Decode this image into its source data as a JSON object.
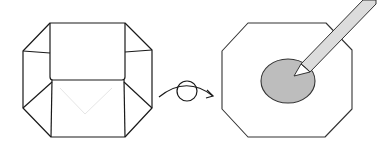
{
  "diagram": {
    "title": "Flip the folded box over and color the center",
    "colors": {
      "stroke": "#1a1a1a",
      "faint_crease": "#e4e4e4",
      "background": "#ffffff",
      "ellipse_fill": "#bdbdbd",
      "pencil_fill": "#dcdcdc",
      "pencil_stroke": "#333333"
    },
    "steps": [
      {
        "id": "folded-box",
        "description": "Octagonal folded paper box viewed from above with side flaps and a front panel"
      },
      {
        "id": "flip-arrow",
        "description": "Curved arrow with a circle indicating turn over",
        "icon": "turn-over-arrow-icon"
      },
      {
        "id": "colored-octagon",
        "description": "Flipped octagon with a pencil shading a gray oval in the center",
        "icon": "pencil-icon"
      }
    ]
  }
}
